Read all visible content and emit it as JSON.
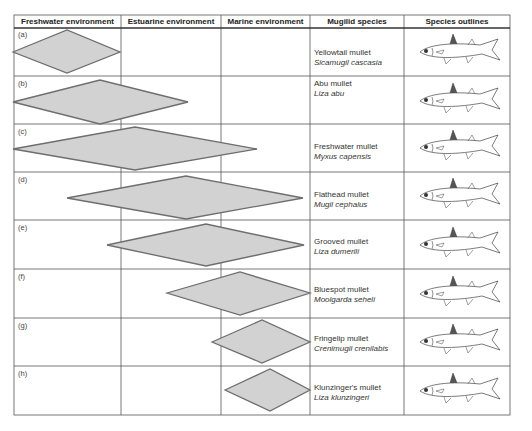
{
  "headers": {
    "freshwater": "Freshwater environment",
    "estuarine": "Estuarine environment",
    "marine": "Marine environment",
    "species": "Mugilid species",
    "outlines": "Species outlines"
  },
  "rows": [
    {
      "label": "(a)",
      "common": "Yellowtail mullet",
      "scientific": "Sicamugil cascasia"
    },
    {
      "label": "(b)",
      "common": "Abu mullet",
      "scientific": "Liza abu"
    },
    {
      "label": "(c)",
      "common": "Freshwater mullet",
      "scientific": "Myxus capensis"
    },
    {
      "label": "(d)",
      "common": "Flathead mullet",
      "scientific": "Mugil cephalus"
    },
    {
      "label": "(e)",
      "common": "Grooved mullet",
      "scientific": "Liza dumerili"
    },
    {
      "label": "(f)",
      "common": "Bluespot mullet",
      "scientific": "Moolgarda seheli"
    },
    {
      "label": "(g)",
      "common": "Fringelip mullet",
      "scientific": "Crenimugil crenilabis"
    },
    {
      "label": "(h)",
      "common": "Klunzinger's mullet",
      "scientific": "Liza klunzingeri"
    }
  ],
  "colors": {
    "diamond_fill": "#d2d2d2",
    "diamond_stroke": "#6e6e6e",
    "grid": "#555555"
  }
}
